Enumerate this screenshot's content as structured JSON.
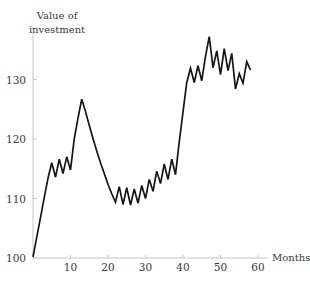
{
  "chart_data": {
    "type": "line",
    "title": "",
    "ylabel": "Value of\ninvestment",
    "xlabel": "Months",
    "xlim": [
      0,
      62
    ],
    "ylim": [
      98,
      140
    ],
    "grid": false,
    "legend": "none",
    "xticks": [
      10,
      20,
      30,
      40,
      50,
      60
    ],
    "xticklabels": [
      "10",
      "20",
      "30",
      "40",
      "50",
      "60"
    ],
    "yticks": [
      100,
      110,
      120,
      130
    ],
    "yticklabels": [
      "100",
      "110",
      "120",
      "130"
    ],
    "series": [
      {
        "name": "Value of investment",
        "x": [
          0,
          1,
          2,
          3,
          4,
          5,
          6,
          7,
          8,
          9,
          10,
          11,
          12,
          13,
          14,
          15,
          16,
          17,
          18,
          19,
          20,
          21,
          22,
          23,
          24,
          25,
          26,
          27,
          28,
          29,
          30,
          31,
          32,
          33,
          34,
          35,
          36,
          37,
          38,
          39,
          40,
          41,
          42,
          43,
          44,
          45,
          46,
          47,
          48,
          49,
          50,
          51,
          52,
          53,
          54,
          55,
          56,
          57,
          58
        ],
        "values": [
          100.2,
          103.5,
          106.8,
          110.2,
          113.4,
          116.0,
          113.6,
          116.6,
          114.2,
          117.0,
          114.8,
          120.0,
          123.5,
          126.7,
          124.6,
          122.3,
          120.1,
          118.0,
          116.0,
          114.2,
          112.4,
          110.8,
          109.4,
          112.0,
          109.0,
          111.8,
          108.9,
          111.6,
          109.2,
          112.2,
          110.0,
          113.2,
          111.2,
          114.6,
          112.5,
          115.8,
          113.2,
          116.6,
          114.0,
          119.5,
          124.5,
          129.5,
          131.9,
          129.5,
          132.3,
          129.8,
          133.9,
          137.2,
          132.0,
          134.8,
          130.8,
          135.2,
          131.5,
          134.4,
          128.4,
          131.0,
          129.4,
          133.0,
          131.6
        ]
      }
    ]
  },
  "axis_titles": {
    "y": "Value of\ninvestment",
    "x": "Months"
  }
}
